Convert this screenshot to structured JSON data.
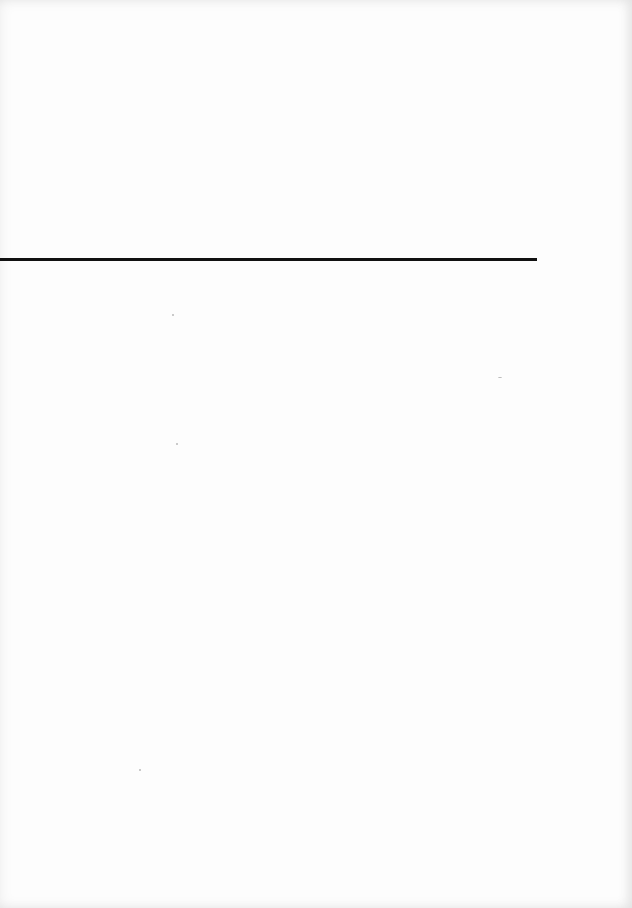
{
  "page": {
    "background_color": "#fdfdfd",
    "content_text": "",
    "rule": {
      "color": "#111111",
      "x_start": 0,
      "x_end": 537,
      "y": 258,
      "thickness": 3
    }
  }
}
